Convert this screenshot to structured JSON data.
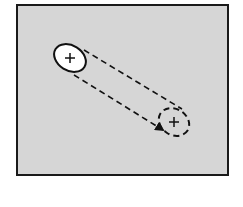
{
  "canvas": {
    "width": 243,
    "height": 207,
    "background": "#ffffff"
  },
  "frame": {
    "x": 17,
    "y": 5,
    "width": 211,
    "height": 170,
    "fill": "#d6d6d6",
    "stroke": "#1a1a1a",
    "stroke_width": 2
  },
  "colors": {
    "ink": "#111111",
    "ellipse_fill": "#ffffff",
    "frame_fill": "#d6d6d6"
  },
  "shapes": {
    "start_ellipse": {
      "cx": 70,
      "cy": 58,
      "rx": 17,
      "ry": 12.5,
      "rotate": 32,
      "style": "solid",
      "marker": "plus"
    },
    "end_ellipse": {
      "cx": 174,
      "cy": 122,
      "rx": 16,
      "ry": 13,
      "rotate": 32,
      "style": "dashed",
      "marker": "plus"
    },
    "path_upper": {
      "x1": 84,
      "y1": 50,
      "x2": 182,
      "y2": 109,
      "style": "dashed"
    },
    "path_lower": {
      "x1": 74,
      "y1": 75,
      "x2": 163,
      "y2": 130,
      "style": "dashed",
      "arrowhead": true
    }
  }
}
